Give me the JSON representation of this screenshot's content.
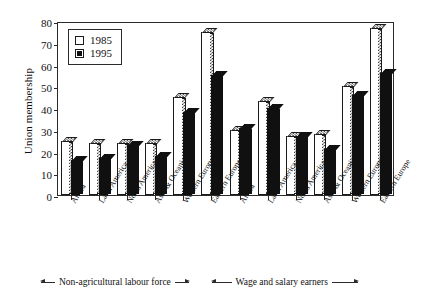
{
  "chart_data": {
    "type": "bar",
    "title": "",
    "xlabel": "",
    "ylabel": "Union membership",
    "ylim": [
      0,
      80
    ],
    "yticks": [
      0,
      10,
      20,
      30,
      40,
      50,
      60,
      70,
      80
    ],
    "grid": false,
    "legend_position": "top-left",
    "categories": [
      "Africa",
      "Latin America",
      "North America",
      "Asia & Oceania",
      "Western Europe",
      "Eastern Europe",
      "Africa",
      "Latin America",
      "North America",
      "Asia & Oceania",
      "Western Europe",
      "Eastern Europe"
    ],
    "series": [
      {
        "name": "1985",
        "color": "#ffffff",
        "values": [
          25,
          24,
          24,
          24,
          45,
          75,
          30,
          43,
          27,
          28,
          50,
          77
        ]
      },
      {
        "name": "1995",
        "color": "#101010",
        "values": [
          16,
          17,
          23,
          18,
          38,
          55,
          31,
          40,
          27,
          21,
          46,
          56
        ]
      }
    ],
    "group_annotations": [
      {
        "label": "Non-agricultural labour force",
        "span": [
          0,
          5
        ]
      },
      {
        "label": "Wage and salary earners",
        "span": [
          6,
          11
        ]
      }
    ]
  },
  "legend": {
    "entries": [
      {
        "label": "1985",
        "style": "open"
      },
      {
        "label": "1995",
        "style": "filled"
      }
    ]
  },
  "axis": {
    "y_title": "Union membership",
    "y_tick_labels": [
      "0",
      "10",
      "20",
      "30",
      "40",
      "50",
      "60",
      "70",
      "80"
    ]
  },
  "annotations": {
    "left_band": "Non-agricultural labour force",
    "right_band": "Wage and salary earners"
  }
}
